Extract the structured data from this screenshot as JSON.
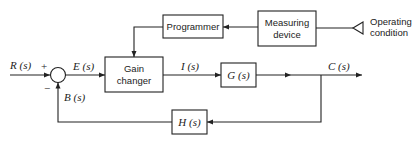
{
  "diagram": {
    "type": "control-system-block-diagram",
    "blocks": {
      "programmer": "Programmer",
      "measuring_device_line1": "Measuring",
      "measuring_device_line2": "device",
      "gain_changer_line1": "Gain",
      "gain_changer_line2": "changer",
      "plant": "G (s)",
      "feedback": "H (s)"
    },
    "signals": {
      "input": "R (s)",
      "error": "E (s)",
      "intermediate": "I (s)",
      "output": "C (s)",
      "feedback": "B (s)"
    },
    "summing_junction": {
      "plus": "+",
      "minus": "−"
    },
    "external_input": {
      "line1": "Operating",
      "line2": "condition"
    }
  }
}
